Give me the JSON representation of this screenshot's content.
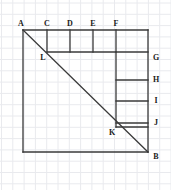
{
  "figure": {
    "colors": {
      "background": "#ffffff",
      "grid": "#e9eaee",
      "grid_major": "#e2e3e8",
      "stroke": "#3a3a3a",
      "label": "#1a1a1a"
    },
    "grid": {
      "visible": true,
      "cell_size": 11.3,
      "origin_x": 1.5,
      "origin_y": 3.0,
      "columns": 15,
      "rows": 17
    },
    "square": {
      "top_left_x": 23,
      "top_left_y": 30,
      "bottom_right_x": 148,
      "bottom_right_y": 152
    },
    "diagonal": {
      "from": "A",
      "to": "B"
    },
    "top_dividers_x": [
      47,
      70,
      93,
      116
    ],
    "top_divider_bottom_y": 52,
    "right_column_x": 116,
    "right_column_bottom_y": 127,
    "right_rungs_y": [
      52,
      80,
      101,
      123
    ],
    "inner_horizontal_start_x": 47,
    "inner_horizontal_y": 52,
    "stroke_width": 1.3,
    "points": [
      {
        "id": "A",
        "label": "A",
        "x": 23,
        "y": 30,
        "label_x": 21,
        "label_y": 24
      },
      {
        "id": "C",
        "label": "C",
        "x": 47,
        "y": 30,
        "label_x": 47,
        "label_y": 24
      },
      {
        "id": "D",
        "label": "D",
        "x": 70,
        "y": 30,
        "label_x": 70,
        "label_y": 24
      },
      {
        "id": "E",
        "label": "E",
        "x": 93,
        "y": 30,
        "label_x": 93,
        "label_y": 24
      },
      {
        "id": "F",
        "label": "F",
        "x": 116,
        "y": 30,
        "label_x": 116,
        "label_y": 24
      },
      {
        "id": "G",
        "label": "G",
        "x": 148,
        "y": 52,
        "label_x": 156,
        "label_y": 58
      },
      {
        "id": "H",
        "label": "H",
        "x": 148,
        "y": 80,
        "label_x": 156,
        "label_y": 80
      },
      {
        "id": "I",
        "label": "I",
        "x": 148,
        "y": 101,
        "label_x": 156,
        "label_y": 101
      },
      {
        "id": "J",
        "label": "J",
        "x": 148,
        "y": 123,
        "label_x": 156,
        "label_y": 123
      },
      {
        "id": "B",
        "label": "B",
        "x": 148,
        "y": 152,
        "label_x": 156,
        "label_y": 157
      },
      {
        "id": "K",
        "label": "K",
        "x": 116,
        "y": 127,
        "label_x": 112,
        "label_y": 133
      },
      {
        "id": "L",
        "label": "L",
        "x": 47,
        "y": 52,
        "label_x": 43,
        "label_y": 58
      }
    ]
  }
}
